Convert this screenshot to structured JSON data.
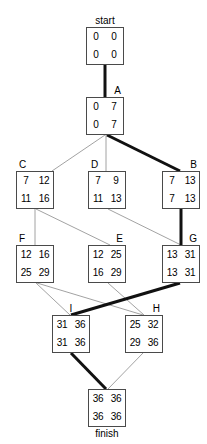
{
  "diagram": {
    "type": "activity-on-node-network",
    "width": 207,
    "height": 444,
    "colors": {
      "box_border": "#4a4a4a",
      "edge": "#8a8a8a",
      "critical_edge": "#111111",
      "text": "#000000",
      "background": "#ffffff"
    },
    "nodes": [
      {
        "id": "start",
        "label": "start",
        "label_position": "top-center",
        "x": 86,
        "y": 27,
        "cells": {
          "top_left": "0",
          "top_right": "0",
          "bottom_left": "0",
          "bottom_right": "0"
        }
      },
      {
        "id": "A",
        "label": "A",
        "label_position": "top-right",
        "x": 86,
        "y": 97,
        "cells": {
          "top_left": "0",
          "top_right": "7",
          "bottom_left": "0",
          "bottom_right": "7"
        }
      },
      {
        "id": "C",
        "label": "C",
        "label_position": "top-left",
        "x": 16,
        "y": 171,
        "cells": {
          "top_left": "7",
          "top_right": "12",
          "bottom_left": "11",
          "bottom_right": "16"
        }
      },
      {
        "id": "D",
        "label": "D",
        "label_position": "top-left",
        "x": 88,
        "y": 171,
        "cells": {
          "top_left": "7",
          "top_right": "9",
          "bottom_left": "11",
          "bottom_right": "13"
        }
      },
      {
        "id": "B",
        "label": "B",
        "label_position": "top-right",
        "x": 162,
        "y": 171,
        "cells": {
          "top_left": "7",
          "top_right": "13",
          "bottom_left": "7",
          "bottom_right": "13"
        }
      },
      {
        "id": "F",
        "label": "F",
        "label_position": "top-left",
        "x": 16,
        "y": 245,
        "cells": {
          "top_left": "12",
          "top_right": "16",
          "bottom_left": "25",
          "bottom_right": "29"
        }
      },
      {
        "id": "E",
        "label": "E",
        "label_position": "top-right",
        "x": 88,
        "y": 245,
        "cells": {
          "top_left": "12",
          "top_right": "25",
          "bottom_left": "16",
          "bottom_right": "29"
        }
      },
      {
        "id": "G",
        "label": "G",
        "label_position": "top-right",
        "x": 162,
        "y": 245,
        "cells": {
          "top_left": "13",
          "top_right": "31",
          "bottom_left": "13",
          "bottom_right": "31"
        }
      },
      {
        "id": "I",
        "label": "I",
        "label_position": "top-center",
        "x": 52,
        "y": 315,
        "cells": {
          "top_left": "31",
          "top_right": "36",
          "bottom_left": "31",
          "bottom_right": "36"
        }
      },
      {
        "id": "H",
        "label": "H",
        "label_position": "top-right",
        "x": 125,
        "y": 315,
        "cells": {
          "top_left": "25",
          "top_right": "32",
          "bottom_left": "29",
          "bottom_right": "36"
        }
      },
      {
        "id": "finish",
        "label": "finish",
        "label_position": "bottom-center",
        "x": 88,
        "y": 389,
        "cells": {
          "top_left": "36",
          "top_right": "36",
          "bottom_left": "36",
          "bottom_right": "36"
        }
      }
    ],
    "edges": [
      {
        "from": "start",
        "to": "A",
        "x1": 105,
        "y1": 65,
        "x2": 105,
        "y2": 97,
        "critical": true
      },
      {
        "from": "A",
        "to": "C",
        "x1": 105,
        "y1": 135,
        "x2": 52,
        "y2": 171,
        "critical": false
      },
      {
        "from": "A",
        "to": "D",
        "x1": 106,
        "y1": 135,
        "x2": 106,
        "y2": 171,
        "critical": false
      },
      {
        "from": "A",
        "to": "B",
        "x1": 107,
        "y1": 135,
        "x2": 180,
        "y2": 171,
        "critical": true
      },
      {
        "from": "C",
        "to": "F",
        "x1": 35,
        "y1": 209,
        "x2": 35,
        "y2": 245,
        "critical": false
      },
      {
        "from": "C",
        "to": "E",
        "x1": 36,
        "y1": 209,
        "x2": 110,
        "y2": 245,
        "critical": false
      },
      {
        "from": "D",
        "to": "G",
        "x1": 108,
        "y1": 209,
        "x2": 181,
        "y2": 245,
        "critical": false
      },
      {
        "from": "B",
        "to": "G",
        "x1": 181,
        "y1": 209,
        "x2": 181,
        "y2": 245,
        "critical": true
      },
      {
        "from": "F",
        "to": "I",
        "x1": 36,
        "y1": 283,
        "x2": 70,
        "y2": 315,
        "critical": false
      },
      {
        "from": "F",
        "to": "H",
        "x1": 37,
        "y1": 283,
        "x2": 143,
        "y2": 315,
        "critical": false
      },
      {
        "from": "E",
        "to": "H",
        "x1": 108,
        "y1": 283,
        "x2": 144,
        "y2": 315,
        "critical": false
      },
      {
        "from": "G",
        "to": "I",
        "x1": 180,
        "y1": 283,
        "x2": 71,
        "y2": 315,
        "critical": true
      },
      {
        "from": "I",
        "to": "finish",
        "x1": 71,
        "y1": 353,
        "x2": 106,
        "y2": 389,
        "critical": true
      },
      {
        "from": "H",
        "to": "finish",
        "x1": 143,
        "y1": 353,
        "x2": 108,
        "y2": 389,
        "critical": false
      }
    ]
  }
}
